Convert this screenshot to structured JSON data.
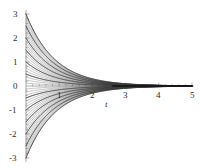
{
  "chart_data": {
    "type": "line",
    "title": "",
    "subtitle": "",
    "xlabel": "t",
    "ylabel": "",
    "xlim": [
      0,
      5
    ],
    "ylim": [
      -3,
      3
    ],
    "xticks": [
      1,
      2,
      3,
      4,
      5
    ],
    "xtick_labels": [
      "1",
      "2",
      "3",
      "4",
      "5"
    ],
    "yticks": [
      3,
      2,
      1,
      0,
      -1,
      -2,
      -3
    ],
    "ytick_labels": [
      "3",
      "2",
      "1",
      "0",
      "-1",
      "-2",
      "-3"
    ],
    "grid": false,
    "legend": "none",
    "minor_ticks": true,
    "axis_color": "#9a9a9a",
    "curve_color": "#3a3a3a",
    "x": [
      0,
      0.25,
      0.5,
      0.75,
      1,
      1.25,
      1.5,
      1.75,
      2,
      2.25,
      2.5,
      2.75,
      3,
      3.25,
      3.5,
      3.75,
      4,
      4.25,
      4.5,
      4.75,
      5
    ],
    "decay_rate": 1.15,
    "series": [
      {
        "name": "C=3",
        "C": 3.0,
        "values": [
          3.0,
          2.25,
          1.685,
          1.262,
          0.946,
          0.709,
          0.531,
          0.398,
          0.298,
          0.223,
          0.167,
          0.125,
          0.094,
          0.07,
          0.053,
          0.039,
          0.03,
          0.022,
          0.017,
          0.012,
          0.009
        ]
      },
      {
        "name": "C=2.5",
        "C": 2.5,
        "values": [
          2.5,
          1.875,
          1.405,
          1.052,
          0.789,
          0.591,
          0.443,
          0.332,
          0.249,
          0.186,
          0.14,
          0.105,
          0.078,
          0.059,
          0.044,
          0.033,
          0.025,
          0.018,
          0.014,
          0.01,
          0.008
        ]
      },
      {
        "name": "C=2",
        "C": 2.0,
        "values": [
          2.0,
          1.5,
          1.124,
          0.842,
          0.631,
          0.473,
          0.354,
          0.265,
          0.199,
          0.149,
          0.112,
          0.084,
          0.063,
          0.047,
          0.035,
          0.026,
          0.02,
          0.015,
          0.011,
          0.008,
          0.006
        ]
      },
      {
        "name": "C=1.5",
        "C": 1.5,
        "values": [
          1.5,
          1.125,
          0.843,
          0.631,
          0.473,
          0.355,
          0.266,
          0.199,
          0.149,
          0.112,
          0.084,
          0.063,
          0.047,
          0.035,
          0.026,
          0.02,
          0.015,
          0.011,
          0.008,
          0.006,
          0.005
        ]
      },
      {
        "name": "C=1",
        "C": 1.0,
        "values": [
          1.0,
          0.75,
          0.562,
          0.421,
          0.316,
          0.236,
          0.177,
          0.133,
          0.1,
          0.075,
          0.056,
          0.042,
          0.031,
          0.023,
          0.018,
          0.013,
          0.01,
          0.007,
          0.006,
          0.004,
          0.003
        ]
      },
      {
        "name": "C=0.5",
        "C": 0.5,
        "values": [
          0.5,
          0.375,
          0.281,
          0.21,
          0.158,
          0.118,
          0.089,
          0.066,
          0.05,
          0.037,
          0.028,
          0.021,
          0.016,
          0.012,
          0.009,
          0.007,
          0.005,
          0.004,
          0.003,
          0.002,
          0.002
        ]
      },
      {
        "name": "C=-0.5",
        "C": -0.5,
        "values": [
          -0.5,
          -0.375,
          -0.281,
          -0.21,
          -0.158,
          -0.118,
          -0.089,
          -0.066,
          -0.05,
          -0.037,
          -0.028,
          -0.021,
          -0.016,
          -0.012,
          -0.009,
          -0.007,
          -0.005,
          -0.004,
          -0.003,
          -0.002,
          -0.002
        ]
      },
      {
        "name": "C=-1",
        "C": -1.0,
        "values": [
          -1.0,
          -0.75,
          -0.562,
          -0.421,
          -0.316,
          -0.236,
          -0.177,
          -0.133,
          -0.1,
          -0.075,
          -0.056,
          -0.042,
          -0.031,
          -0.023,
          -0.018,
          -0.013,
          -0.01,
          -0.007,
          -0.006,
          -0.004,
          -0.003
        ]
      },
      {
        "name": "C=-1.5",
        "C": -1.5,
        "values": [
          -1.5,
          -1.125,
          -0.843,
          -0.631,
          -0.473,
          -0.355,
          -0.266,
          -0.199,
          -0.149,
          -0.112,
          -0.084,
          -0.063,
          -0.047,
          -0.035,
          -0.026,
          -0.02,
          -0.015,
          -0.011,
          -0.008,
          -0.006,
          -0.005
        ]
      },
      {
        "name": "C=-2",
        "C": -2.0,
        "values": [
          -2.0,
          -1.5,
          -1.124,
          -0.842,
          -0.631,
          -0.473,
          -0.354,
          -0.265,
          -0.199,
          -0.149,
          -0.112,
          -0.084,
          -0.063,
          -0.047,
          -0.035,
          -0.026,
          -0.02,
          -0.015,
          -0.011,
          -0.008,
          -0.006
        ]
      },
      {
        "name": "C=-2.5",
        "C": -2.5,
        "values": [
          -2.5,
          -1.875,
          -1.405,
          -1.052,
          -0.789,
          -0.591,
          -0.443,
          -0.332,
          -0.249,
          -0.186,
          -0.14,
          -0.105,
          -0.078,
          -0.059,
          -0.044,
          -0.033,
          -0.025,
          -0.018,
          -0.014,
          -0.01,
          -0.008
        ]
      },
      {
        "name": "C=-3",
        "C": -3.0,
        "values": [
          -3.0,
          -2.25,
          -1.685,
          -1.262,
          -0.946,
          -0.709,
          -0.531,
          -0.398,
          -0.298,
          -0.223,
          -0.167,
          -0.125,
          -0.094,
          -0.07,
          -0.053,
          -0.039,
          -0.03,
          -0.022,
          -0.017,
          -0.012,
          -0.009
        ]
      }
    ]
  },
  "axes": {
    "x_label": "t",
    "x_tick_labels": [
      "1",
      "2",
      "3",
      "4",
      "5"
    ],
    "y_tick_labels": [
      "3",
      "2",
      "1",
      "0",
      "-1",
      "-2",
      "-3"
    ]
  }
}
